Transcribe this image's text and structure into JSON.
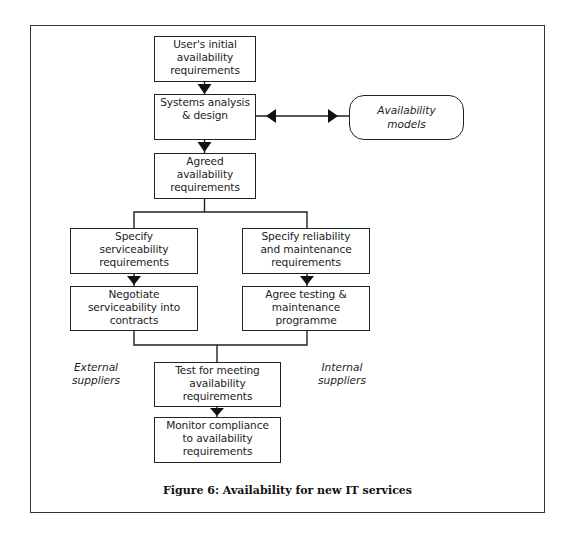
{
  "diagram": {
    "type": "flowchart",
    "nodes": [
      {
        "id": "user_initial",
        "label": "User's initial\navailability\nrequirements",
        "shape": "rect"
      },
      {
        "id": "systems_analysis",
        "label": "Systems analysis\n& design",
        "shape": "rect"
      },
      {
        "id": "availability_models",
        "label": "Availability\nmodels",
        "shape": "rounded",
        "style": "italic"
      },
      {
        "id": "agreed",
        "label": "Agreed\navailability\nrequirements",
        "shape": "rect"
      },
      {
        "id": "specify_serviceability",
        "label": "Specify\nserviceability\nrequirements",
        "shape": "rect"
      },
      {
        "id": "specify_reliability",
        "label": "Specify reliability\nand maintenance\nrequirements",
        "shape": "rect"
      },
      {
        "id": "negotiate",
        "label": "Negotiate\nserviceability into\ncontracts",
        "shape": "rect"
      },
      {
        "id": "agree_testing",
        "label": "Agree testing &\nmaintenance\nprogramme",
        "shape": "rect"
      },
      {
        "id": "test_meeting",
        "label": "Test for meeting\navailability\nrequirements",
        "shape": "rect"
      },
      {
        "id": "monitor",
        "label": "Monitor compliance\nto availability\nrequirements",
        "shape": "rect"
      }
    ],
    "edges": [
      {
        "from": "user_initial",
        "to": "systems_analysis",
        "arrow": "forward"
      },
      {
        "from": "systems_analysis",
        "to": "availability_models",
        "arrow": "both"
      },
      {
        "from": "systems_analysis",
        "to": "agreed",
        "arrow": "forward"
      },
      {
        "from": "agreed",
        "to": "specify_serviceability",
        "arrow": "none"
      },
      {
        "from": "agreed",
        "to": "specify_reliability",
        "arrow": "none"
      },
      {
        "from": "specify_serviceability",
        "to": "negotiate",
        "arrow": "forward"
      },
      {
        "from": "specify_reliability",
        "to": "agree_testing",
        "arrow": "forward"
      },
      {
        "from": "negotiate",
        "to": "test_meeting",
        "arrow": "none"
      },
      {
        "from": "agree_testing",
        "to": "test_meeting",
        "arrow": "none"
      },
      {
        "from": "test_meeting",
        "to": "monitor",
        "arrow": "forward"
      }
    ],
    "side_labels": {
      "left": "External\nsuppliers",
      "right": "Internal\nsuppliers"
    },
    "caption": "Figure 6: Availability for new IT services"
  }
}
